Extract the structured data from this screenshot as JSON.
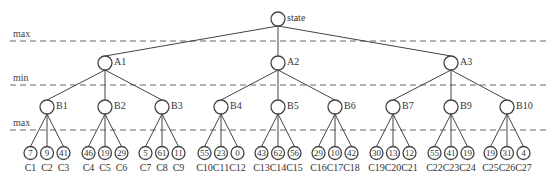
{
  "diagram": {
    "type": "minimax-game-tree",
    "levels": [
      {
        "label": "max",
        "line_y": 41
      },
      {
        "label": "min",
        "line_y": 85
      },
      {
        "label": "max",
        "line_y": 130
      }
    ],
    "root": {
      "id": "state",
      "label": "state",
      "x": 278,
      "y": 19
    },
    "level1": [
      {
        "id": "A1",
        "label": "A1",
        "x": 105,
        "y": 63
      },
      {
        "id": "A2",
        "label": "A2",
        "x": 278,
        "y": 63
      },
      {
        "id": "A3",
        "label": "A3",
        "x": 451,
        "y": 63
      }
    ],
    "level2": [
      {
        "id": "B1",
        "label": "B1",
        "parent": "A1",
        "x": 47,
        "y": 107
      },
      {
        "id": "B2",
        "label": "B2",
        "parent": "A1",
        "x": 105,
        "y": 107
      },
      {
        "id": "B3",
        "label": "B3",
        "parent": "A1",
        "x": 162,
        "y": 107
      },
      {
        "id": "B4",
        "label": "B4",
        "parent": "A2",
        "x": 221,
        "y": 107
      },
      {
        "id": "B5",
        "label": "B5",
        "parent": "A2",
        "x": 278,
        "y": 107
      },
      {
        "id": "B6",
        "label": "B6",
        "parent": "A2",
        "x": 335,
        "y": 107
      },
      {
        "id": "B7",
        "label": "B7",
        "parent": "A3",
        "x": 393,
        "y": 107
      },
      {
        "id": "B9",
        "label": "B9",
        "parent": "A3",
        "x": 451,
        "y": 107
      },
      {
        "id": "B10",
        "label": "B10",
        "parent": "A3",
        "x": 507,
        "y": 107
      }
    ],
    "leaves": [
      {
        "label": "C1",
        "value": "7",
        "parent": "B1"
      },
      {
        "label": "C2",
        "value": "9",
        "parent": "B1"
      },
      {
        "label": "C3",
        "value": "41",
        "parent": "B1"
      },
      {
        "label": "C4",
        "value": "46",
        "parent": "B2"
      },
      {
        "label": "C5",
        "value": "19",
        "parent": "B2"
      },
      {
        "label": "C6",
        "value": "29",
        "parent": "B2"
      },
      {
        "label": "C7",
        "value": "5",
        "parent": "B3"
      },
      {
        "label": "C8",
        "value": "61",
        "parent": "B3"
      },
      {
        "label": "C9",
        "value": "11",
        "parent": "B3"
      },
      {
        "label": "C10",
        "value": "55",
        "parent": "B4"
      },
      {
        "label": "C11",
        "value": "23",
        "parent": "B4"
      },
      {
        "label": "C12",
        "value": "0",
        "parent": "B4"
      },
      {
        "label": "C13",
        "value": "43",
        "parent": "B5"
      },
      {
        "label": "C14",
        "value": "62",
        "parent": "B5"
      },
      {
        "label": "C15",
        "value": "56",
        "parent": "B5"
      },
      {
        "label": "C16",
        "value": "29",
        "parent": "B6"
      },
      {
        "label": "C17",
        "value": "10",
        "parent": "B6"
      },
      {
        "label": "C18",
        "value": "42",
        "parent": "B6"
      },
      {
        "label": "C19",
        "value": "30",
        "parent": "B7"
      },
      {
        "label": "C20",
        "value": "13",
        "parent": "B7"
      },
      {
        "label": "C21",
        "value": "12",
        "parent": "B7"
      },
      {
        "label": "C22",
        "value": "55",
        "parent": "B9"
      },
      {
        "label": "C23",
        "value": "41",
        "parent": "B9"
      },
      {
        "label": "C24",
        "value": "19",
        "parent": "B9"
      },
      {
        "label": "C25",
        "value": "19",
        "parent": "B10"
      },
      {
        "label": "C26",
        "value": "31",
        "parent": "B10"
      },
      {
        "label": "C27",
        "value": "4",
        "parent": "B10"
      }
    ],
    "colors": {
      "line": "#444444",
      "dash": "#666666",
      "text": "#333333",
      "background": "#ffffff"
    }
  }
}
